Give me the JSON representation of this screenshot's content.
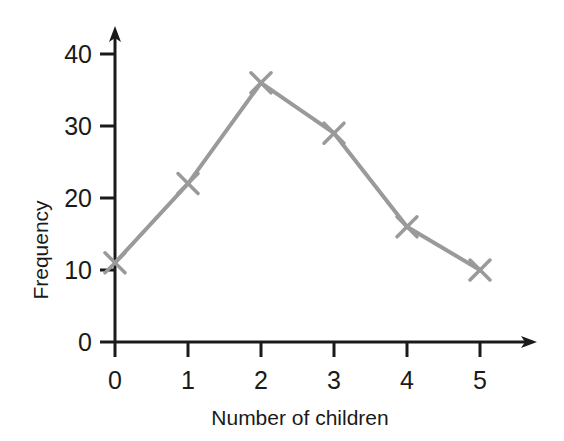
{
  "chart_data": {
    "type": "line",
    "title": "",
    "subtitle": "",
    "xlabel": "Number of children",
    "ylabel": "Frequency",
    "x": [
      0,
      1,
      2,
      3,
      4,
      5
    ],
    "values": [
      11,
      22,
      36,
      29,
      16,
      10
    ],
    "series": [
      {
        "name": "Frequency",
        "values": [
          11,
          22,
          36,
          29,
          16,
          10
        ]
      }
    ],
    "categories": [
      "0",
      "1",
      "2",
      "3",
      "4",
      "5"
    ],
    "xticklabels": [
      "0",
      "1",
      "2",
      "3",
      "4",
      "5"
    ],
    "yticklabels": [
      "0",
      "10",
      "20",
      "30",
      "40"
    ],
    "yticks": [
      0,
      10,
      20,
      30,
      40
    ],
    "xlim": [
      0,
      5.9
    ],
    "ylim": [
      0,
      43.6
    ],
    "grid": false,
    "legend": false,
    "legend_position": "none",
    "marker": "x",
    "line_color": "#9a9a9a",
    "marker_color": "#9a9a9a",
    "axis_color": "#1a1a1a",
    "background_color": "#ffffff",
    "annotations": []
  },
  "axes": {
    "x_axis_name": "x-axis",
    "y_axis_name": "y-axis",
    "x_arrowhead": "arrow-right",
    "y_arrowhead": "arrow-up"
  }
}
